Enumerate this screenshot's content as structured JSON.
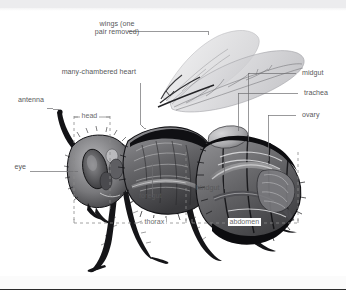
{
  "figure": {
    "title": "",
    "background_color": "#ffffff",
    "label_color": "#58585a",
    "leader_color": "#6e6e70",
    "bracket_color": "#8a8a8c",
    "band_color": "#ececee",
    "rule_color": "#2c2c2c"
  },
  "labels": {
    "wings": "wings (one\npair removed)",
    "heart": "many-chambered heart",
    "antenna": "antenna",
    "eye": "eye",
    "head": "head",
    "midgut": "midgut",
    "trachea": "trachea",
    "ovary": "ovary",
    "foregut": "foregut",
    "hindgut": "hindgut",
    "thorax": "thorax",
    "abdomen": "abdomen"
  },
  "callouts": [
    {
      "name": "wings",
      "text": "wings (one pair removed)",
      "side": "top-left",
      "has_leader": true,
      "has_bracket": false
    },
    {
      "name": "heart",
      "text": "many-chambered heart",
      "side": "top-left",
      "has_leader": true,
      "has_bracket": false
    },
    {
      "name": "antenna",
      "text": "antenna",
      "side": "left",
      "has_leader": true,
      "has_bracket": false
    },
    {
      "name": "eye",
      "text": "eye",
      "side": "left",
      "has_leader": true,
      "has_bracket": false
    },
    {
      "name": "head",
      "text": "head",
      "side": "top",
      "has_leader": false,
      "has_bracket": true
    },
    {
      "name": "midgut",
      "text": "midgut",
      "side": "right",
      "has_leader": true,
      "has_bracket": false
    },
    {
      "name": "trachea",
      "text": "trachea",
      "side": "right",
      "has_leader": true,
      "has_bracket": false
    },
    {
      "name": "ovary",
      "text": "ovary",
      "side": "right",
      "has_leader": true,
      "has_bracket": false
    },
    {
      "name": "foregut",
      "text": "foregut",
      "side": "inside",
      "has_leader": true,
      "has_bracket": false
    },
    {
      "name": "hindgut",
      "text": "hindgut",
      "side": "inside",
      "has_leader": true,
      "has_bracket": false
    },
    {
      "name": "thorax",
      "text": "thorax",
      "side": "bottom",
      "has_leader": false,
      "has_bracket": true
    },
    {
      "name": "abdomen",
      "text": "abdomen",
      "side": "bottom",
      "has_leader": false,
      "has_bracket": true
    }
  ]
}
